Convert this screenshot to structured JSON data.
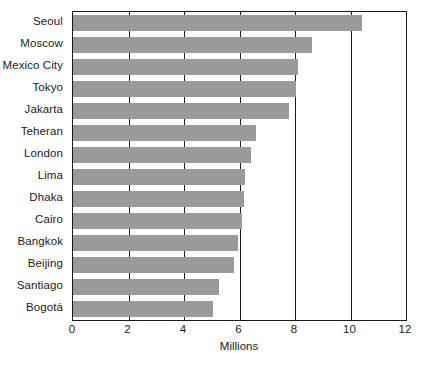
{
  "chart_data": {
    "type": "bar",
    "orientation": "horizontal",
    "title": "",
    "subtitle": "",
    "xlabel": "Millions",
    "ylabel": "",
    "categories": [
      "Seoul",
      "Moscow",
      "Mexico City",
      "Tokyo",
      "Jakarta",
      "Teheran",
      "London",
      "Lima",
      "Dhaka",
      "Cairo",
      "Bangkok",
      "Beijing",
      "Santiago",
      "Bogotá"
    ],
    "values": [
      10.4,
      8.6,
      8.1,
      8.05,
      7.8,
      6.6,
      6.4,
      6.2,
      6.15,
      6.1,
      5.95,
      5.8,
      5.25,
      5.05
    ],
    "xlim": [
      0,
      12
    ],
    "xticks": [
      0,
      2,
      4,
      6,
      8,
      10,
      12
    ],
    "xtick_labels": [
      "0",
      "2",
      "4",
      "6",
      "8",
      "10",
      "12"
    ],
    "grid": "vertical",
    "legend": "none",
    "bar_color": "#9a9a9a",
    "axis_color": "#1b1b1b",
    "background": "#ffffff"
  }
}
